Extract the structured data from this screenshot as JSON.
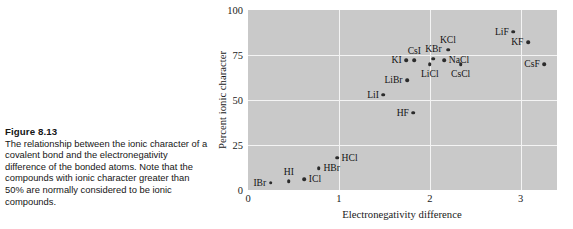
{
  "figure": {
    "number": "Figure 8.13",
    "caption": "The relationship between the ionic character of a covalent bond and the electronegativity difference of the bonded atoms. Note that the compounds with ionic character greater than 50% are normally considered to be ionic compounds."
  },
  "colors": {
    "plot_background": "#c9c9c9",
    "gridline": "#f4f4f4",
    "point": "#2b2b2b",
    "text": "#161616"
  },
  "chart_data": {
    "type": "scatter",
    "title": "",
    "xlabel": "Electronegativity difference",
    "ylabel": "Percent ionic character",
    "xlim": [
      0,
      3.4
    ],
    "ylim": [
      0,
      100
    ],
    "xticks": [
      "0",
      "1",
      "2",
      "3"
    ],
    "xtick_values": [
      0,
      1,
      2,
      3
    ],
    "yticks": [
      "0",
      "25",
      "50",
      "75",
      "100"
    ],
    "ytick_values": [
      0,
      25,
      50,
      75,
      100
    ],
    "grid": true,
    "gridlines_x": [
      1,
      2,
      3
    ],
    "gridlines_y": [
      25,
      50,
      75
    ],
    "legend": "none",
    "points": [
      {
        "label": "IBr",
        "x": 0.25,
        "y": 4,
        "label_pos": "left"
      },
      {
        "label": "HI",
        "x": 0.45,
        "y": 5,
        "label_pos": "above"
      },
      {
        "label": "ICl",
        "x": 0.62,
        "y": 6,
        "label_pos": "right"
      },
      {
        "label": "HBr",
        "x": 0.78,
        "y": 12,
        "label_pos": "right"
      },
      {
        "label": "HCl",
        "x": 0.98,
        "y": 18,
        "label_pos": "right"
      },
      {
        "label": "HF",
        "x": 1.82,
        "y": 43,
        "label_pos": "left"
      },
      {
        "label": "LiI",
        "x": 1.49,
        "y": 53,
        "label_pos": "left"
      },
      {
        "label": "LiBr",
        "x": 1.75,
        "y": 61,
        "label_pos": "left"
      },
      {
        "label": "KI",
        "x": 1.74,
        "y": 72,
        "label_pos": "left"
      },
      {
        "label": "CsI",
        "x": 1.83,
        "y": 72,
        "label_pos": "above"
      },
      {
        "label": "LiCl",
        "x": 2.0,
        "y": 70,
        "label_pos": "below"
      },
      {
        "label": "KBr",
        "x": 2.04,
        "y": 73,
        "label_pos": "above"
      },
      {
        "label": "NaCl",
        "x": 2.16,
        "y": 72,
        "label_pos": "right"
      },
      {
        "label": "KCl",
        "x": 2.2,
        "y": 78,
        "label_pos": "above"
      },
      {
        "label": "CsCl",
        "x": 2.34,
        "y": 70,
        "label_pos": "below"
      },
      {
        "label": "LiF",
        "x": 2.92,
        "y": 88,
        "label_pos": "left"
      },
      {
        "label": "KF",
        "x": 3.08,
        "y": 82,
        "label_pos": "left"
      },
      {
        "label": "CsF",
        "x": 3.26,
        "y": 70,
        "label_pos": "left"
      }
    ]
  }
}
